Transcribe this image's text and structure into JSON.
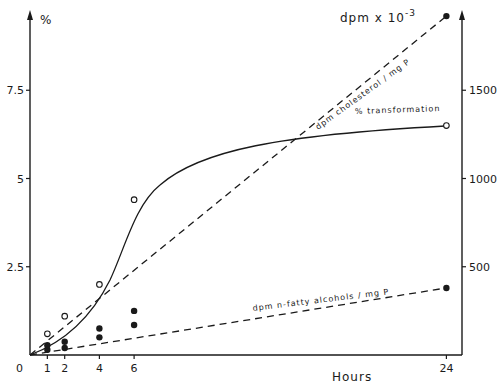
{
  "chart_data": {
    "type": "line",
    "title": "",
    "xlabel": "Hours",
    "x": [
      0,
      1,
      2,
      4,
      6,
      24
    ],
    "x_ticks": [
      "0",
      "1",
      "2",
      "4",
      "6",
      "24"
    ],
    "xlim": [
      0,
      25
    ],
    "y_left": {
      "label": "%",
      "ticks": [
        "2.5",
        "5",
        "7.5"
      ],
      "tick_values": [
        2.5,
        5,
        7.5
      ],
      "ylim": [
        0,
        9.5
      ]
    },
    "y_right": {
      "label": "dpm x 10⁻³",
      "ticks": [
        "500",
        "1000",
        "1500"
      ],
      "tick_values": [
        500,
        1000,
        1500
      ],
      "ylim": [
        0,
        1950
      ]
    },
    "grid": false,
    "legend": "inline annotations",
    "series": [
      {
        "name": "% transformation",
        "axis": "left",
        "marker": "open-circle",
        "line": "solid-smooth",
        "x": [
          1,
          2,
          4,
          6,
          24
        ],
        "values": [
          0.6,
          1.1,
          2.0,
          4.4,
          6.5
        ]
      },
      {
        "name": "dpm cholesterol / mg P",
        "axis": "right",
        "marker": "filled-circle",
        "line": "dashed",
        "x": [
          1,
          2,
          4,
          6,
          24
        ],
        "values": [
          30,
          40,
          100,
          250,
          1920
        ]
      },
      {
        "name": "dpm n-fatty alcohols / mg P",
        "axis": "right",
        "marker": "filled-circle",
        "line": "dashed",
        "x": [
          1,
          2,
          4,
          6,
          24
        ],
        "values": [
          55,
          75,
          150,
          170,
          380
        ]
      }
    ]
  },
  "labels": {
    "left_unit": "%",
    "right_unit_base": "dpm x 10",
    "right_unit_exp": "-3",
    "x_title": "Hours",
    "origin": "0",
    "annot_transformation": "% transformation",
    "annot_cholesterol": "dpm  cholesterol / mg P",
    "annot_fatty": "dpm  n-fatty  alcohols / mg P"
  }
}
